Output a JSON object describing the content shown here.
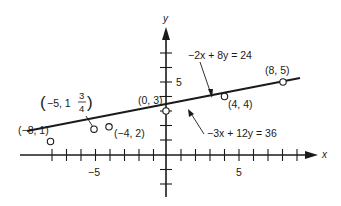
{
  "axes": {
    "x_label": "x",
    "y_label": "y",
    "x_tick_labels": [
      {
        "value": -5,
        "text": "−5"
      },
      {
        "value": 5,
        "text": "5"
      }
    ],
    "y_tick_labels": [
      {
        "value": 5,
        "text": "5"
      }
    ],
    "x_range": [
      -10,
      11
    ],
    "y_range": [
      -3,
      8
    ]
  },
  "line": {
    "equation_1": "−2x + 8y = 24",
    "equation_2": "−3x + 12y = 36",
    "color": "#1a1a1a"
  },
  "points": [
    {
      "x": -8,
      "y": 1,
      "label": "(−8, 1)"
    },
    {
      "x": -5,
      "y": 1.75,
      "label_prefix": "(−5, 1",
      "frac_num": "3",
      "frac_den": "4",
      "label_suffix": ")"
    },
    {
      "x": -4,
      "y": 2,
      "label": "(−4, 2)"
    },
    {
      "x": 0,
      "y": 3,
      "label": "(0, 3)"
    },
    {
      "x": 4,
      "y": 4,
      "label": "(4, 4)"
    },
    {
      "x": 8,
      "y": 5,
      "label": "(8, 5)"
    }
  ]
}
